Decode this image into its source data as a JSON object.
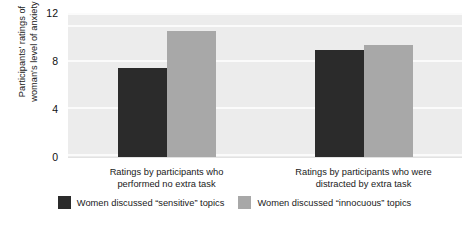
{
  "chart_data": {
    "type": "bar",
    "title": "",
    "xlabel": "",
    "ylabel": "Participants' ratings of\nwoman's level of anxiety",
    "ylim": [
      0,
      12
    ],
    "yticks": [
      0,
      4,
      8,
      12
    ],
    "ytick_labels": [
      "0",
      "4",
      "8",
      "12"
    ],
    "grid": true,
    "grid_axis": "y",
    "legend_position": "bottom",
    "categories": [
      "Ratings by participants who\nperformed no extra task",
      "Ratings by participants who were\ndistracted by extra task"
    ],
    "series": [
      {
        "name": "Women discussed “sensitive” topics",
        "color": "#2b2b2b",
        "values": [
          7.4,
          8.9
        ]
      },
      {
        "name": "Women discussed “innocuous” topics",
        "color": "#a8a8a8",
        "values": [
          10.5,
          9.3
        ]
      }
    ]
  },
  "figure": {
    "plot_background": "#ececec",
    "gridline_color": "#fbfbfb",
    "page_background": "#ffffff",
    "caption": ""
  }
}
